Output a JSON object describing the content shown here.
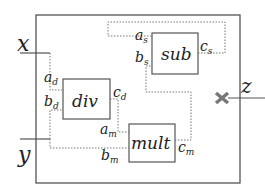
{
  "diagram": {
    "type": "circuit-composition",
    "colors": {
      "solid_line": "#555555",
      "dotted_line": "#777777",
      "text": "#222222",
      "cross_mark": "#777777"
    },
    "inputs": [
      {
        "id": "x",
        "label": "x"
      },
      {
        "id": "y",
        "label": "y"
      }
    ],
    "outputs": [
      {
        "id": "z",
        "label": "z",
        "marker": "cross"
      }
    ],
    "blocks": [
      {
        "id": "div",
        "label": "div",
        "ports": {
          "in1": "a",
          "in1_sub": "d",
          "in2": "b",
          "in2_sub": "d",
          "out": "c",
          "out_sub": "d"
        }
      },
      {
        "id": "sub",
        "label": "sub",
        "ports": {
          "in1": "a",
          "in1_sub": "s",
          "in2": "b",
          "in2_sub": "s",
          "out": "c",
          "out_sub": "s"
        }
      },
      {
        "id": "mult",
        "label": "mult",
        "ports": {
          "in1": "a",
          "in1_sub": "m",
          "in2": "b",
          "in2_sub": "m",
          "out": "c",
          "out_sub": "m"
        }
      }
    ],
    "connections": [
      {
        "from": "x",
        "to": "div.a_d",
        "style": "dotted"
      },
      {
        "from": "y",
        "to": "div.b_d",
        "style": "dotted"
      },
      {
        "from": "y",
        "to": "mult.b_m",
        "style": "dotted"
      },
      {
        "from": "div.c_d",
        "to": "mult.a_m",
        "style": "dotted"
      },
      {
        "from": "mult.c_m",
        "to": "sub.b_s",
        "style": "dotted"
      },
      {
        "from": "sub.c_s",
        "to": "sub.a_s",
        "style": "dotted"
      }
    ]
  }
}
